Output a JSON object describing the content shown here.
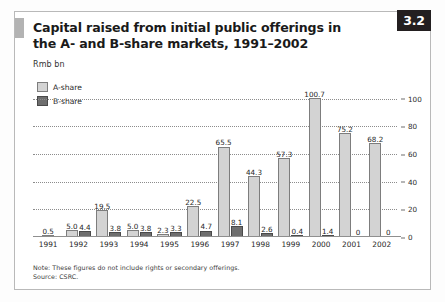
{
  "badge": {
    "label": "3.2"
  },
  "header": {
    "title": "Capital raised from initial public offerings in the A- and B-share markets, 1991–2002",
    "unit": "Rmb bn"
  },
  "legend": {
    "items": [
      {
        "key": "a-share",
        "label": "A-share",
        "color": "#d3d3d3"
      },
      {
        "key": "b-share",
        "label": "B-share",
        "color": "#6e6e6e"
      }
    ]
  },
  "footer": {
    "note": "Note: These figures do not include rights or secondary offerings.",
    "source": "Source: CSRC."
  },
  "chart_data": {
    "type": "bar",
    "title": "Capital raised from initial public offerings in the A- and B-share markets, 1991–2002",
    "xlabel": "",
    "ylabel": "Rmb bn",
    "ylim": [
      0,
      100
    ],
    "yticks": [
      0,
      20,
      40,
      60,
      80,
      100
    ],
    "ytick_labels": [
      "0",
      "20",
      "40",
      "60",
      "80",
      "100"
    ],
    "grid": true,
    "legend_position": "top-left",
    "categories": [
      "1991",
      "1992",
      "1993",
      "1994",
      "1995",
      "1996",
      "1997",
      "1998",
      "1999",
      "2000",
      "2001",
      "2002"
    ],
    "series": [
      {
        "name": "A-share",
        "color": "#d3d3d3",
        "values": [
          0.5,
          5.0,
          19.5,
          5.0,
          2.3,
          22.5,
          65.5,
          44.3,
          57.3,
          100.7,
          75.2,
          68.2
        ],
        "labels": [
          "0.5",
          "5.0",
          "19.5",
          "5.0",
          "2.3",
          "22.5",
          "65.5",
          "44.3",
          "57.3",
          "100.7",
          "75.2",
          "68.2"
        ]
      },
      {
        "name": "B-share",
        "color": "#6e6e6e",
        "values": [
          null,
          4.4,
          3.8,
          3.8,
          3.3,
          4.7,
          8.1,
          2.6,
          0.4,
          1.4,
          0,
          0
        ],
        "labels": [
          "",
          "4.4",
          "3.8",
          "3.8",
          "3.3",
          "4.7",
          "8.1",
          "2.6",
          "0.4",
          "1.4",
          "0",
          "0"
        ]
      }
    ]
  }
}
